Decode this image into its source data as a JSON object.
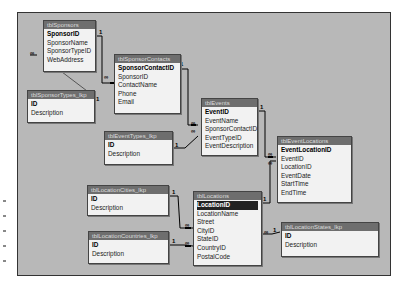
{
  "diagram": {
    "tables": [
      {
        "id": "sponsors",
        "title": "tblSponsors",
        "fields": [
          "SponsorID",
          "SponsorName",
          "SponsorTypeID",
          "WebAddress"
        ],
        "pk": 0
      },
      {
        "id": "sponsor_types",
        "title": "tblSponsorTypes_lkp",
        "fields": [
          "ID",
          "Description"
        ],
        "pk": 0
      },
      {
        "id": "sponsor_contacts",
        "title": "tblSponsorContacts",
        "fields": [
          "SponsorContactID",
          "SponsorID",
          "ContactName",
          "Phone",
          "Email"
        ],
        "pk": 0
      },
      {
        "id": "events",
        "title": "tblEvents",
        "fields": [
          "EventID",
          "EventName",
          "SponsorContactID",
          "EventTypeID",
          "EventDescription"
        ],
        "pk": 0
      },
      {
        "id": "event_types",
        "title": "tblEventTypes_lkp",
        "fields": [
          "ID",
          "Description"
        ],
        "pk": 0
      },
      {
        "id": "event_locations",
        "title": "tblEventLocations",
        "fields": [
          "EventLocationID",
          "EventID",
          "LocationID",
          "EventDate",
          "StartTime",
          "EndTime"
        ],
        "pk": 0
      },
      {
        "id": "locations",
        "title": "tblLocations",
        "fields": [
          "LocationID",
          "LocationName",
          "Street",
          "CityID",
          "StateID",
          "CountryID",
          "PostalCode"
        ],
        "pk": 0
      },
      {
        "id": "location_cities",
        "title": "tblLocationCities_lkp",
        "fields": [
          "ID",
          "Description"
        ],
        "pk": 0
      },
      {
        "id": "location_countries",
        "title": "tblLocationCountries_lkp",
        "fields": [
          "ID",
          "Description"
        ],
        "pk": 0
      },
      {
        "id": "location_states",
        "title": "tblLocationStates_lkp",
        "fields": [
          "ID",
          "Description"
        ],
        "pk": 0
      }
    ],
    "cardinality": {
      "one": "1",
      "many": "∞"
    }
  }
}
